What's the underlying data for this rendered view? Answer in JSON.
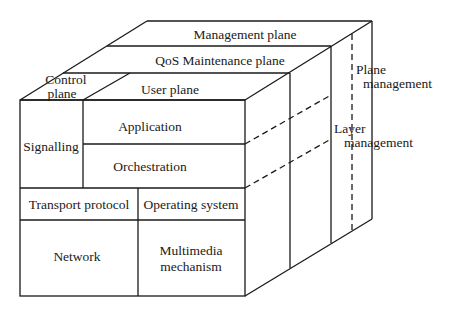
{
  "diagram": {
    "type": "3d-cube-architecture-model",
    "colors": {
      "line": "#1a1a1a",
      "background": "#ffffff"
    },
    "top_face": {
      "planes": [
        {
          "id": "management",
          "label": "Management plane"
        },
        {
          "id": "qos",
          "label": "QoS Maintenance plane"
        },
        {
          "id": "control",
          "label_line1": "Control",
          "label_line2": "plane"
        },
        {
          "id": "user",
          "label": "User plane"
        }
      ]
    },
    "front_face": {
      "cells": [
        {
          "id": "signalling",
          "label": "Signalling"
        },
        {
          "id": "application",
          "label": "Application"
        },
        {
          "id": "orchestration",
          "label": "Orchestration"
        },
        {
          "id": "transport",
          "label": "Transport protocol"
        },
        {
          "id": "os",
          "label": "Operating system"
        },
        {
          "id": "network",
          "label": "Network"
        },
        {
          "id": "multimedia",
          "label_line1": "Multimedia",
          "label_line2": "mechanism"
        }
      ]
    },
    "side_labels": {
      "plane_management": {
        "line1": "Plane",
        "line2": "management"
      },
      "layer_management": {
        "line1": "Layer",
        "line2": "management"
      }
    }
  }
}
